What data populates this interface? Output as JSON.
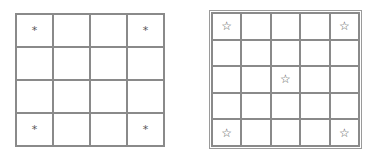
{
  "figures": [
    {
      "id": "grid-a",
      "rows": 4,
      "cols": 4,
      "marker": "*",
      "marker_icon": "asterisk-icon",
      "marked_cells": [
        [
          0,
          0
        ],
        [
          0,
          3
        ],
        [
          3,
          0
        ],
        [
          3,
          3
        ]
      ]
    },
    {
      "id": "grid-b",
      "rows": 5,
      "cols": 5,
      "marker": "☆",
      "marker_icon": "star-outline-icon",
      "marked_cells": [
        [
          0,
          0
        ],
        [
          0,
          4
        ],
        [
          2,
          2
        ],
        [
          4,
          0
        ],
        [
          4,
          4
        ]
      ]
    }
  ],
  "colors": {
    "grid_line": "#8a8a8a",
    "marker": "#555555",
    "background": "#ffffff"
  }
}
